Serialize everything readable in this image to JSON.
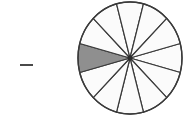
{
  "figure": {
    "dash_mark": {
      "glyph": "minus-sign",
      "label": "–",
      "color": "#4a4a4a",
      "x": 20,
      "y": 64,
      "width": 13,
      "height": 2
    },
    "pie": {
      "icon_name": "fraction-circle",
      "center_x": 54,
      "center_y": 58,
      "radius_x": 52,
      "radius_y": 56,
      "total_sectors": 12,
      "shaded_sectors": 1,
      "fraction_label": "1/12",
      "sector_angle_degrees": 30,
      "start_angle_degrees": -15,
      "outline_color": "#3a3a3a",
      "outline_width": 1.4,
      "divider_color": "#3a3a3a",
      "divider_width": 1.2,
      "unshaded_fill": "#fbfbfb",
      "shaded_fill": "#8f8f8f",
      "center_dot_color": "#2b2b2b",
      "center_dot_radius": 2.4,
      "shaded_sector_index": 6
    }
  },
  "chart_data": {
    "type": "pie",
    "title": "",
    "categories": [
      "shaded",
      "unshaded"
    ],
    "values": [
      1,
      11
    ],
    "slice_count": 12,
    "slice_value": 1,
    "equal_slices": true,
    "colors": [
      "#8f8f8f",
      "#fbfbfb"
    ],
    "legend": "none",
    "labels_shown": false
  }
}
